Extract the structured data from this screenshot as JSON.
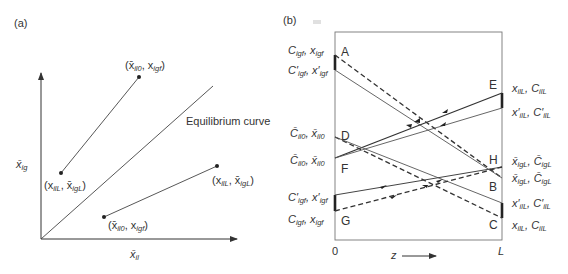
{
  "panel_a": {
    "label": "(a)",
    "x_axis_label": "x̄",
    "x_axis_sub": "il",
    "y_axis_label": "x̄",
    "y_axis_sub": "ig",
    "curve_label": "Equilibrium curve",
    "upper_line": {
      "start_label_main1": "(x",
      "start_label_sub1": "ilL",
      "start_label_main2": ", x̄",
      "start_label_sub2": "igL",
      "start_label_end": ")",
      "end_label_main1": "(x̄",
      "end_label_sub1": "il0",
      "end_label_main2": ", x",
      "end_label_sub2": "igf",
      "end_label_end": ")"
    },
    "lower_line": {
      "start_label_main1": "(x̄",
      "start_label_sub1": "il0",
      "start_label_main2": ", x",
      "start_label_sub2": "igf",
      "start_label_end": ")",
      "end_label_main1": "(x",
      "end_label_sub1": "ilL",
      "end_label_main2": ", x̄",
      "end_label_sub2": "igL",
      "end_label_end": ")"
    }
  },
  "panel_b": {
    "label": "(b)",
    "x_start": "0",
    "x_end": "L",
    "x_axis_label": "z",
    "points": {
      "A": "A",
      "B": "B",
      "C": "C",
      "D": "D",
      "E": "E",
      "F": "F",
      "G": "G",
      "H": "H"
    },
    "left_labels": [
      {
        "m1": "C",
        "s1": "igf",
        "m2": ", x",
        "s2": "igf"
      },
      {
        "m1": "C′",
        "s1": "igf",
        "m2": ", x′",
        "s2": "igf"
      },
      {
        "m1": "C̄",
        "s1": "il0",
        "m2": ", x̄",
        "s2": "il0"
      },
      {
        "m1": "C̄",
        "s1": "il0",
        "m2": ", x̄",
        "s2": "il0"
      },
      {
        "m1": "C′",
        "s1": "igf",
        "m2": ", x′",
        "s2": "igf"
      },
      {
        "m1": "C",
        "s1": "igf",
        "m2": ", x",
        "s2": "igf"
      }
    ],
    "right_labels": [
      {
        "m1": "x",
        "s1": "ilL",
        "m2": ", C",
        "s2": "ilL"
      },
      {
        "m1": "x′",
        "s1": "ilL",
        "m2": ", C′",
        "s2": "ilL"
      },
      {
        "m1": "x̄",
        "s1": "igL",
        "m2": ", C̄",
        "s2": "igL"
      },
      {
        "m1": "x̄",
        "s1": "igL",
        "m2": ", C̄",
        "s2": "igL"
      },
      {
        "m1": "x′",
        "s1": "ilL",
        "m2": ", C′",
        "s2": "ilL"
      },
      {
        "m1": "x",
        "s1": "ilL",
        "m2": ", C",
        "s2": "ilL"
      }
    ]
  }
}
